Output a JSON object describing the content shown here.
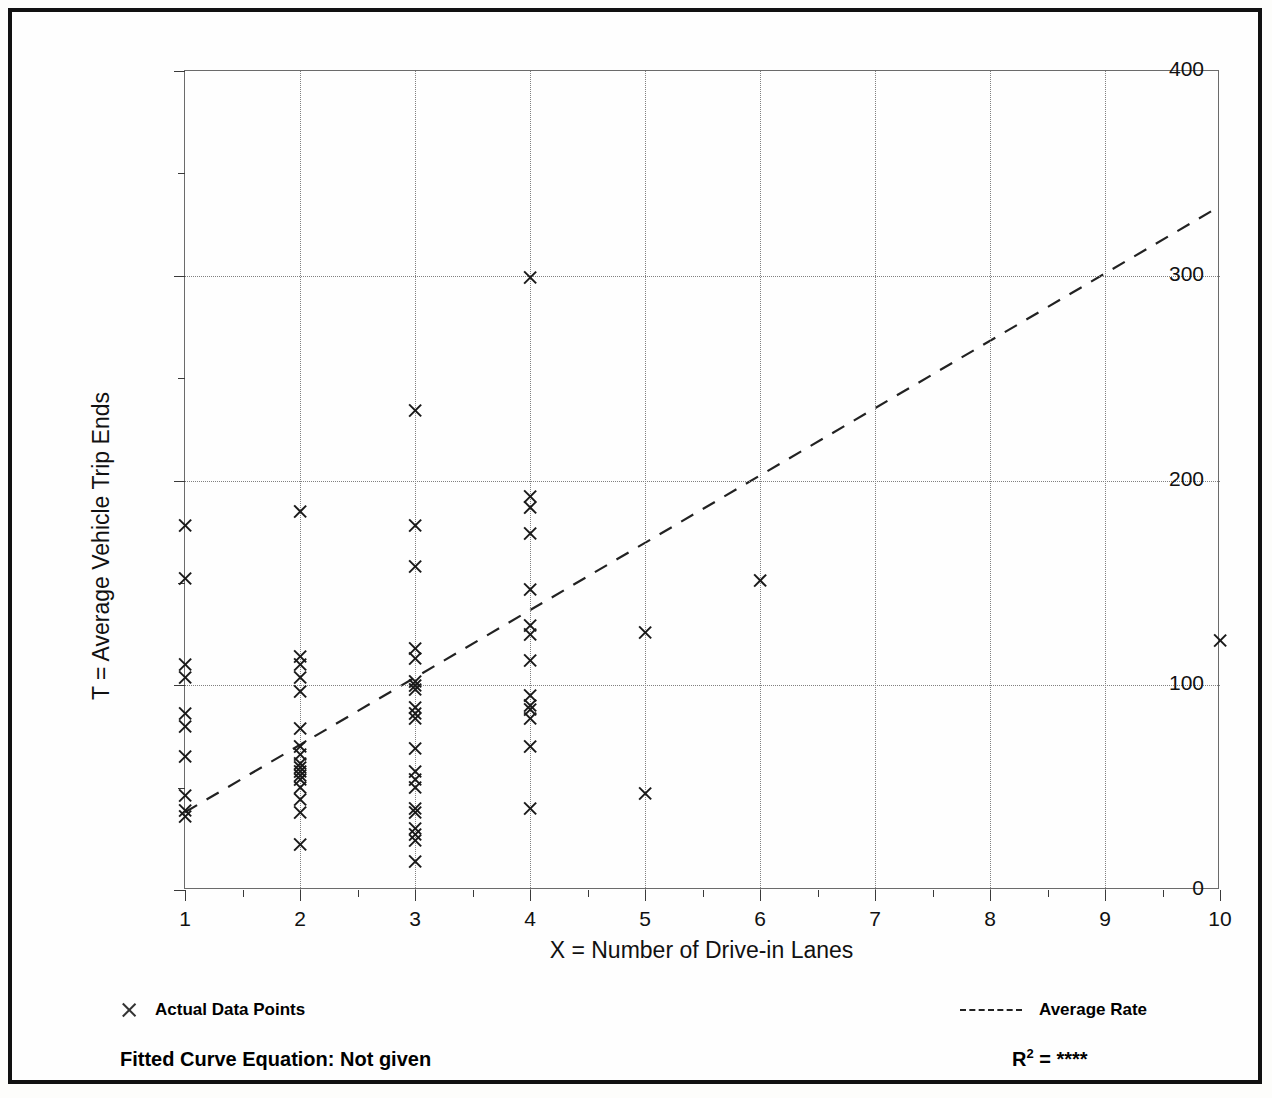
{
  "chart_data": {
    "type": "scatter",
    "title": "",
    "xlabel": "X = Number of Drive-in Lanes",
    "ylabel": "T = Average Vehicle Trip Ends",
    "xlim": [
      1,
      10
    ],
    "ylim": [
      0,
      400
    ],
    "xticks": [
      "1",
      "2",
      "3",
      "4",
      "5",
      "6",
      "7",
      "8",
      "9",
      "10"
    ],
    "yticks": [
      "0",
      "100",
      "200",
      "300",
      "400"
    ],
    "y_minor_ticks": [
      50,
      150,
      250,
      350
    ],
    "grid": "dotted vertical at each integer X, dotted horizontal at 100/200/300",
    "legend_position": "below plot, left and right",
    "series": [
      {
        "name": "Actual Data Points",
        "marker": "x",
        "points": [
          [
            1,
            178
          ],
          [
            1,
            152
          ],
          [
            1,
            110
          ],
          [
            1,
            104
          ],
          [
            1,
            86
          ],
          [
            1,
            80
          ],
          [
            1,
            65
          ],
          [
            1,
            46
          ],
          [
            1,
            39
          ],
          [
            1,
            36
          ],
          [
            2,
            185
          ],
          [
            2,
            114
          ],
          [
            2,
            110
          ],
          [
            2,
            104
          ],
          [
            2,
            97
          ],
          [
            2,
            79
          ],
          [
            2,
            70
          ],
          [
            2,
            66
          ],
          [
            2,
            62
          ],
          [
            2,
            60
          ],
          [
            2,
            58
          ],
          [
            2,
            56
          ],
          [
            2,
            54
          ],
          [
            2,
            50
          ],
          [
            2,
            44
          ],
          [
            2,
            38
          ],
          [
            2,
            22
          ],
          [
            3,
            234
          ],
          [
            3,
            178
          ],
          [
            3,
            158
          ],
          [
            3,
            118
          ],
          [
            3,
            113
          ],
          [
            3,
            102
          ],
          [
            3,
            100
          ],
          [
            3,
            98
          ],
          [
            3,
            89
          ],
          [
            3,
            86
          ],
          [
            3,
            84
          ],
          [
            3,
            69
          ],
          [
            3,
            58
          ],
          [
            3,
            54
          ],
          [
            3,
            50
          ],
          [
            3,
            40
          ],
          [
            3,
            38
          ],
          [
            3,
            30
          ],
          [
            3,
            27
          ],
          [
            3,
            24
          ],
          [
            3,
            14
          ],
          [
            4,
            299
          ],
          [
            4,
            192
          ],
          [
            4,
            187
          ],
          [
            4,
            174
          ],
          [
            4,
            147
          ],
          [
            4,
            129
          ],
          [
            4,
            125
          ],
          [
            4,
            112
          ],
          [
            4,
            95
          ],
          [
            4,
            90
          ],
          [
            4,
            88
          ],
          [
            4,
            84
          ],
          [
            4,
            70
          ],
          [
            4,
            40
          ],
          [
            5,
            126
          ],
          [
            5,
            47
          ],
          [
            6,
            151
          ],
          [
            10,
            122
          ]
        ]
      },
      {
        "name": "Average Rate",
        "style": "dashed line",
        "points": [
          [
            1,
            38
          ],
          [
            10,
            334
          ]
        ]
      }
    ],
    "footer": {
      "fitted_curve_label": "Fitted Curve Equation:  Not given",
      "r2_label": "R",
      "r2_exponent": "2",
      "r2_equals": " = ",
      "r2_value": "****"
    }
  },
  "legend": {
    "actual_label": "Actual Data Points",
    "average_label": "Average Rate"
  },
  "colors": {
    "marker": "#1a1a1a",
    "trend": "#222222",
    "grid": "#808080",
    "frame": "#111111"
  }
}
